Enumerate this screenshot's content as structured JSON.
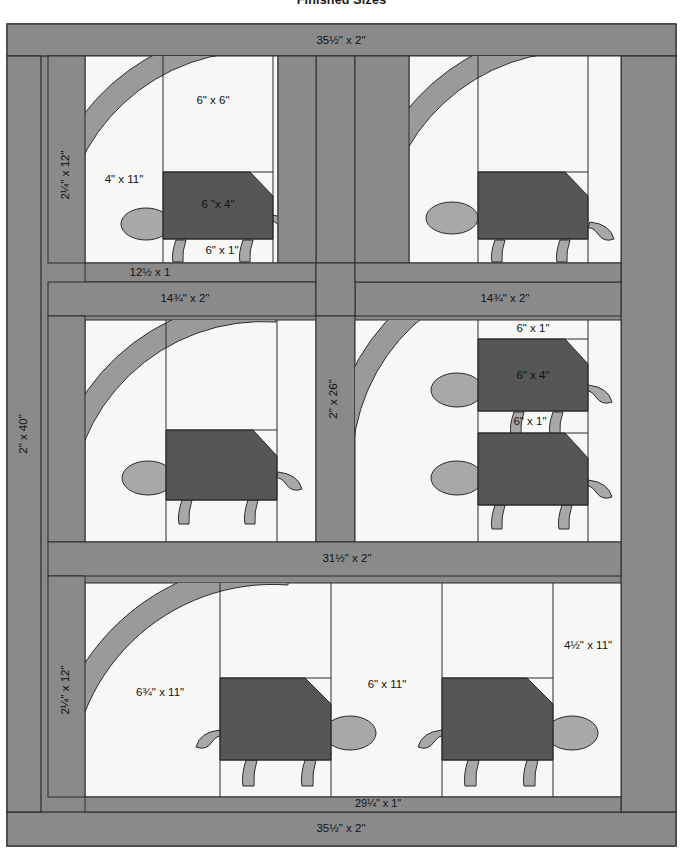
{
  "figure": {
    "title": "Finished Sizes",
    "type": "quilt-pattern-diagram"
  },
  "colors": {
    "background": "#ffffff",
    "sashing_gray": "#8a8a8a",
    "border_gray": "#8a8a8a",
    "shell_dark": "#565656",
    "accent_mid_gray": "#9a9a9a",
    "limb_gray": "#a8a8a8",
    "patch_white": "#f7f7f5",
    "outline": "#2b2b2b"
  },
  "labels": {
    "top_border": "35½\" x 2\"",
    "bottom_border": "35½\" x 2\"",
    "left_border": "2\" x 40\"",
    "left_sash_top": "2¼\" x 12\"",
    "left_sash_bottom": "2¼\" x 12\"",
    "center_sash_vertical": "2\" x 26\"",
    "row1_col1_right_strip": "2½\" x 11\"",
    "row1_col1_left_strip": "4\" x 11\"",
    "row1_col1_top_patch": "6\" x 6\"",
    "shell_top_left": "6 \"x 4\"",
    "foot_strip_top_left": "6\" x 1\"",
    "sash_12_5": "12½ x 1",
    "sash_14_75_left": "14¾\" x 2\"",
    "sash_14_75_right": "14¾\" x 2\"",
    "mid_right_neck": "6\" x 1\"",
    "mid_right_shell": "6\" x 4\"",
    "mid_right_foot": "6\" x 1\"",
    "sash_31_5": "31½\" x 2\"",
    "bottom_left_patch": "6¾\" x 11\"",
    "bottom_mid_patch": "6\" x 11\"",
    "bottom_right_patch": "4½\" x 11\"",
    "bottom_inner_sash": "29¼\" x 1\""
  }
}
